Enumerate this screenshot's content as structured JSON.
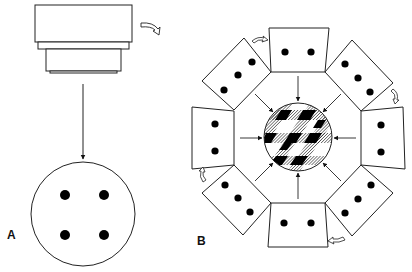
{
  "figure": {
    "panel_a": {
      "label": "A",
      "elements": [
        "objective-lens",
        "rotation-arrow",
        "projection-arrow",
        "field-circle-with-4-dots"
      ],
      "dots": 4
    },
    "panel_b": {
      "label": "B",
      "elements": [
        "8 rotated fields arranged in octagon",
        "rotation arrows",
        "inward arrows",
        "superimposed hatched composite circle"
      ],
      "fields": 8,
      "inward_arrows": 8
    },
    "colors": {
      "line": "#222222",
      "dot": "#000000",
      "background": "#ffffff"
    }
  }
}
